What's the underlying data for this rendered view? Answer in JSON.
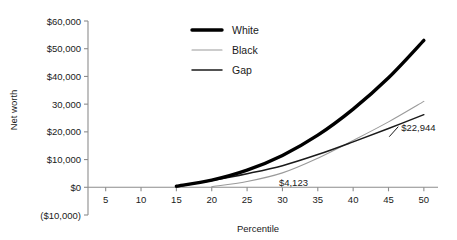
{
  "chart_data": {
    "type": "line",
    "title": "",
    "xlabel": "Percentile",
    "ylabel": "Net worth",
    "xlim": [
      2.5,
      52
    ],
    "ylim": [
      -10000,
      60000
    ],
    "grid": false,
    "legend_position": "top-center",
    "x_ticks": [
      5,
      10,
      15,
      20,
      25,
      30,
      35,
      40,
      45,
      50
    ],
    "x_tick_labels": [
      "5",
      "10",
      "15",
      "20",
      "25",
      "30",
      "35",
      "40",
      "45",
      "50"
    ],
    "y_ticks": [
      -10000,
      0,
      10000,
      20000,
      30000,
      40000,
      50000,
      60000
    ],
    "y_tick_labels": [
      "($10,000)",
      "$0",
      "$10,000",
      "$20,000",
      "30,000",
      "$40,000",
      "$50,000",
      "$60,000"
    ],
    "series": [
      {
        "name": "White",
        "color": "#000000",
        "width": 3.4,
        "x": [
          15,
          20,
          25,
          30,
          35,
          40,
          45,
          50
        ],
        "values": [
          400,
          2600,
          6200,
          11500,
          18800,
          28200,
          39500,
          53000
        ]
      },
      {
        "name": "Black",
        "color": "#9a9a9a",
        "width": 1.1,
        "x": [
          20,
          25,
          30,
          35,
          40,
          45,
          50
        ],
        "values": [
          200,
          2100,
          5200,
          10500,
          16900,
          23600,
          31000
        ]
      },
      {
        "name": "Gap",
        "color": "#1a1a1a",
        "width": 1.5,
        "x": [
          15,
          20,
          25,
          30,
          35,
          40,
          45,
          50
        ],
        "values": [
          200,
          2400,
          4900,
          7800,
          11800,
          16400,
          21200,
          26200
        ]
      }
    ],
    "annotations": [
      {
        "text": "$4,123",
        "x": 29.5,
        "y": 1500
      },
      {
        "text": "$22,944",
        "x": 48.5,
        "y": 21500
      }
    ]
  },
  "legend": {
    "items": [
      {
        "label": "White"
      },
      {
        "label": "Black"
      },
      {
        "label": "Gap"
      }
    ]
  }
}
